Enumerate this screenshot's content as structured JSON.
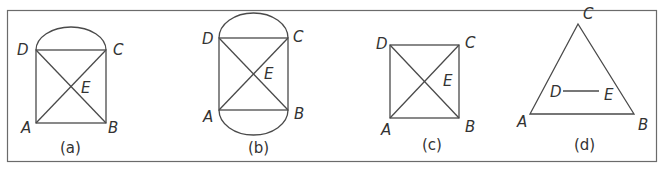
{
  "figure": {
    "frame_color": "#6b6b6b",
    "line_color": "#4a4a4a",
    "panels": [
      {
        "id": "a",
        "caption": "(a)",
        "labels": {
          "A": "A",
          "B": "B",
          "C": "C",
          "D": "D",
          "E": "E"
        },
        "description": "Square ABCD with diagonals meeting at E and a semicircle on top side DC"
      },
      {
        "id": "b",
        "caption": "(b)",
        "labels": {
          "A": "A",
          "B": "B",
          "C": "C",
          "D": "D",
          "E": "E"
        },
        "description": "Square ABCD with diagonals meeting at E and semicircles on top side DC and bottom side AB"
      },
      {
        "id": "c",
        "caption": "(c)",
        "labels": {
          "A": "A",
          "B": "B",
          "C": "C",
          "D": "D",
          "E": "E"
        },
        "description": "Square ABCD with diagonals meeting at E"
      },
      {
        "id": "d",
        "caption": "(d)",
        "labels": {
          "A": "A",
          "B": "B",
          "C": "C",
          "D": "D",
          "E": "E"
        },
        "description": "Triangle ABC with segment DE inside, parallel to AB"
      }
    ]
  }
}
